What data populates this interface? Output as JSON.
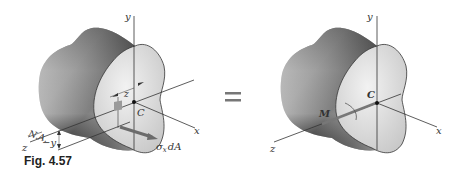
{
  "figure": {
    "caption": "Fig. 4.57",
    "equals_sign": "="
  },
  "left_panel": {
    "axes": {
      "y": "y",
      "x": "x",
      "z": "z"
    },
    "centroid_label": "C",
    "neutral_axis_label": "N.A.",
    "distance_label_y": "−y",
    "distance_label_z": "z",
    "force_label": "σ",
    "force_subscript": "x",
    "force_suffix": "dA"
  },
  "right_panel": {
    "axes": {
      "y": "y",
      "x": "x",
      "z": "z"
    },
    "centroid_label": "C",
    "moment_label": "M"
  },
  "colors": {
    "axis": "#333333",
    "face_light": "#e6e6e6",
    "body_dark": "#3a3a3a",
    "arrow": "#6b6b6b",
    "element": "#9a9a9a"
  }
}
